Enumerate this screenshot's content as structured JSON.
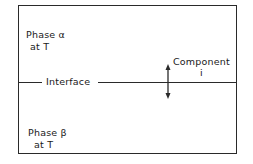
{
  "diagram": {
    "phase_alpha": {
      "line1": "Phase α",
      "line2": "at T"
    },
    "phase_beta": {
      "line1": "Phase β",
      "line2": "at T"
    },
    "interface_label": "Interface",
    "component": {
      "line1": "Component",
      "line2": "i"
    },
    "arrow": "double-headed vertical arrow (transfer across interface)",
    "colors": {
      "line": "#2a2a2a",
      "background": "#ffffff"
    }
  }
}
